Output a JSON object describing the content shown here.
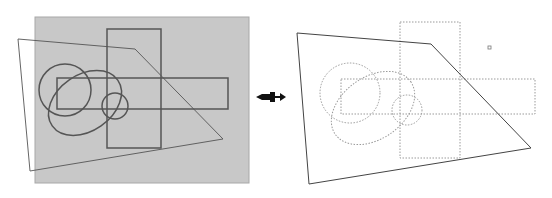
{
  "diagram": {
    "colors": {
      "background_panel": "#c8c8c8",
      "panel_border": "#a8a8a8",
      "left_stroke": "#555555",
      "right_dotted_stroke": "#9a9a9a",
      "right_polygon_stroke": "#444444",
      "arrow": "#111111"
    },
    "left_panel": {
      "panel": {
        "x": 35,
        "y": 17,
        "w": 214,
        "h": 166
      },
      "tall_rect": {
        "x": 107,
        "y": 29,
        "w": 54,
        "h": 119
      },
      "wide_rect": {
        "x": 57,
        "y": 78,
        "w": 171,
        "h": 31
      },
      "polygon": "18,39 135,49 223,139 30,171",
      "circle_large": {
        "cx": 65,
        "cy": 90,
        "r": 26
      },
      "ellipse": {
        "cx": 85,
        "cy": 103,
        "rx": 40,
        "ry": 28,
        "rotate": -35
      },
      "circle_small": {
        "cx": 115,
        "cy": 106,
        "r": 13
      }
    },
    "arrow": {
      "x": 255,
      "y": 92,
      "icon": "arrow-right-icon"
    },
    "right_panel": {
      "tall_rect": {
        "x": 400,
        "y": 22,
        "w": 60,
        "h": 136
      },
      "wide_rect": {
        "x": 341,
        "y": 79,
        "w": 194,
        "h": 35
      },
      "polygon": "297,33 431,44 531,148 309,184",
      "circle_large": {
        "cx": 350,
        "cy": 93,
        "r": 30
      },
      "ellipse": {
        "cx": 373,
        "cy": 108,
        "rx": 46,
        "ry": 31,
        "rotate": -35
      },
      "circle_small": {
        "cx": 407,
        "cy": 110,
        "r": 15
      },
      "marker": {
        "x": 488,
        "y": 46,
        "w": 3,
        "h": 3
      }
    }
  }
}
